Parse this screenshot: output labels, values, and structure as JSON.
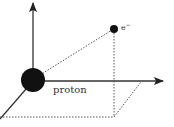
{
  "diagram": {
    "labels": {
      "proton": "proton",
      "electron": "e",
      "electron_charge": "−"
    },
    "colors": {
      "ink": "#222222",
      "dotted": "#555555",
      "background": "#ffffff"
    }
  }
}
